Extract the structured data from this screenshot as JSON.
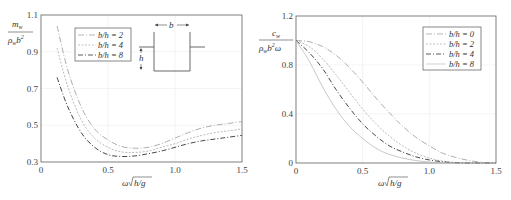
{
  "chart_data": [
    {
      "type": "line",
      "title": "",
      "xlabel": "ω√(h/g)",
      "ylabel": "m_w / (ρ_w b²)",
      "xlim": [
        0,
        1.5
      ],
      "ylim": [
        0.3,
        1.1
      ],
      "xticks": [
        "0",
        "0.5",
        "1.0",
        "1.5"
      ],
      "yticks": [
        "0.3",
        "0.5",
        "0.7",
        "0.9",
        "1.1"
      ],
      "grid": true,
      "legend_position": "upper-left-inner",
      "inset": {
        "description": "rectangular section of width b and draft h",
        "labels": [
          "b",
          "h"
        ]
      },
      "x": [
        0.12,
        0.2,
        0.3,
        0.4,
        0.5,
        0.6,
        0.7,
        0.8,
        0.9,
        1.0,
        1.1,
        1.2,
        1.3,
        1.4,
        1.5
      ],
      "series": [
        {
          "name": "b/h = 2",
          "values": [
            1.04,
            0.8,
            0.6,
            0.48,
            0.42,
            0.385,
            0.375,
            0.38,
            0.4,
            0.43,
            0.46,
            0.485,
            0.5,
            0.51,
            0.52
          ]
        },
        {
          "name": "b/h = 4",
          "values": [
            0.92,
            0.71,
            0.53,
            0.43,
            0.38,
            0.355,
            0.352,
            0.36,
            0.38,
            0.4,
            0.425,
            0.445,
            0.46,
            0.47,
            0.48
          ]
        },
        {
          "name": "b/h = 8",
          "values": [
            0.76,
            0.6,
            0.46,
            0.38,
            0.34,
            0.33,
            0.333,
            0.345,
            0.36,
            0.38,
            0.4,
            0.415,
            0.425,
            0.435,
            0.445
          ]
        }
      ]
    },
    {
      "type": "line",
      "title": "",
      "xlabel": "ω√(h/g)",
      "ylabel": "c_w / (ρ_w b² ω)",
      "xlim": [
        0,
        1.5
      ],
      "ylim": [
        0,
        1.2
      ],
      "xticks": [
        "0",
        "0.5",
        "1.0",
        "1.5"
      ],
      "yticks": [
        "0",
        "0.4",
        "0.8",
        "1.2"
      ],
      "grid": true,
      "legend_position": "upper-right-inner",
      "x": [
        0,
        0.1,
        0.2,
        0.3,
        0.4,
        0.5,
        0.6,
        0.7,
        0.8,
        0.9,
        1.0,
        1.1,
        1.2,
        1.3,
        1.4,
        1.5
      ],
      "series": [
        {
          "name": "b/h = 0",
          "values": [
            1.0,
            0.99,
            0.95,
            0.88,
            0.78,
            0.66,
            0.53,
            0.41,
            0.3,
            0.21,
            0.14,
            0.08,
            0.045,
            0.02,
            0.005,
            0.0
          ]
        },
        {
          "name": "b/h = 2",
          "values": [
            1.0,
            0.95,
            0.85,
            0.72,
            0.58,
            0.44,
            0.32,
            0.22,
            0.14,
            0.08,
            0.04,
            0.015,
            0.004,
            0.0,
            0.0,
            0.0
          ]
        },
        {
          "name": "b/h = 4",
          "values": [
            1.0,
            0.9,
            0.77,
            0.6,
            0.45,
            0.32,
            0.22,
            0.14,
            0.09,
            0.05,
            0.025,
            0.01,
            0.002,
            0.0,
            0.0,
            0.0
          ]
        },
        {
          "name": "b/h = 8",
          "values": [
            1.0,
            0.83,
            0.62,
            0.44,
            0.3,
            0.2,
            0.12,
            0.07,
            0.04,
            0.02,
            0.008,
            0.002,
            0.0,
            0.0,
            0.0,
            0.0
          ]
        }
      ]
    }
  ],
  "left": {
    "ylabel_num": "m",
    "ylabel_num_sub": "w",
    "ylabel_den": "ρ",
    "ylabel_den_sub": "w",
    "ylabel_den_b": "b",
    "ylabel_den_sup": "2",
    "xlabel_omega": "ω",
    "xlabel_root": "h/g",
    "legend": [
      "b/h = 2",
      "b/h = 4",
      "b/h = 8"
    ],
    "inset_b": "b",
    "inset_h": "h"
  },
  "right": {
    "ylabel_num": "c",
    "ylabel_num_sub": "w",
    "ylabel_den": "ρ",
    "ylabel_den_sub": "w",
    "ylabel_den_b": "b",
    "ylabel_den_sup": "2",
    "ylabel_den_omega": "ω",
    "xlabel_omega": "ω",
    "xlabel_root": "h/g",
    "legend": [
      "b/h = 0",
      "b/h = 2",
      "b/h = 4",
      "b/h = 8"
    ]
  },
  "colors": {
    "axis": "#555555",
    "grid": "#e8e8e8",
    "series_dark": "#333333",
    "series_mid": "#777777",
    "series_light": "#aaaaaa"
  }
}
